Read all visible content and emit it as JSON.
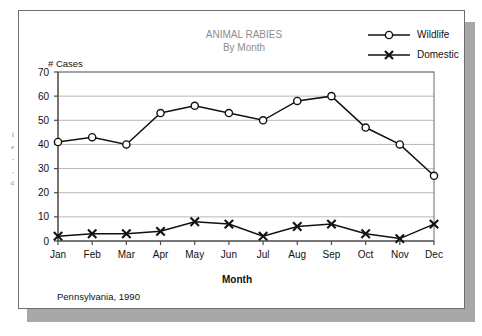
{
  "figure": {
    "title_line1": "ANIMAL RABIES",
    "title_line2": "By Month",
    "caption": "Pennsylvania, 1990",
    "title_color": "#8d8d8d",
    "card_border_color": "#6e6e6e",
    "shadow_color": "#a8a8a8"
  },
  "legend": {
    "position": "top-right",
    "items": [
      {
        "label": "Wildlife",
        "marker": "circle-marker-icon"
      },
      {
        "label": "Domestic",
        "marker": "x-marker-icon"
      }
    ]
  },
  "edge_scraps": [
    {
      "text": "f"
    },
    {
      "text": "e"
    },
    {
      "text": "-"
    },
    {
      "text": ","
    },
    {
      "text": "d"
    }
  ],
  "chart_data": {
    "type": "line",
    "title": "ANIMAL RABIES By Month",
    "subtitle": "Pennsylvania, 1990",
    "xlabel": "Month",
    "ylabel": "# Cases",
    "ylim": [
      0,
      70
    ],
    "ytick_step": 10,
    "yticks": [
      0,
      10,
      20,
      30,
      40,
      50,
      60,
      70
    ],
    "grid": true,
    "legend_position": "top-right",
    "categories": [
      "Jan",
      "Feb",
      "Mar",
      "Apr",
      "May",
      "Jun",
      "Jul",
      "Aug",
      "Sep",
      "Oct",
      "Nov",
      "Dec"
    ],
    "series": [
      {
        "name": "Wildlife",
        "marker": "circle",
        "values": [
          41,
          43,
          40,
          53,
          56,
          53,
          50,
          58,
          60,
          47,
          40,
          27
        ]
      },
      {
        "name": "Domestic",
        "marker": "x",
        "values": [
          2,
          3,
          3,
          4,
          8,
          7,
          2,
          6,
          7,
          3,
          1,
          7
        ]
      }
    ]
  }
}
